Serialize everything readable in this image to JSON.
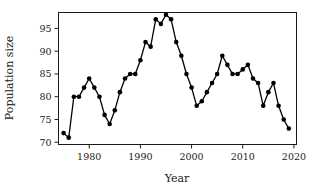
{
  "chart_data": {
    "type": "line",
    "title": "",
    "xlabel": "Year",
    "ylabel": "Population size",
    "xlim": [
      1974,
      2020.5
    ],
    "ylim": [
      69.5,
      98.5
    ],
    "xticks": [
      1980,
      1990,
      2000,
      2010,
      2020
    ],
    "yticks": [
      70,
      75,
      80,
      85,
      90,
      95
    ],
    "grid": false,
    "legend": null,
    "marker": "filled-circle",
    "line_color": "#000000",
    "marker_color": "#000000",
    "x": [
      1975,
      1976,
      1977,
      1978,
      1979,
      1980,
      1981,
      1982,
      1983,
      1984,
      1985,
      1986,
      1987,
      1988,
      1989,
      1990,
      1991,
      1992,
      1993,
      1994,
      1995,
      1996,
      1997,
      1998,
      1999,
      2000,
      2001,
      2002,
      2003,
      2004,
      2005,
      2006,
      2007,
      2008,
      2009,
      2010,
      2011,
      2012,
      2013,
      2014,
      2015,
      2016,
      2017,
      2018,
      2019
    ],
    "values": [
      72,
      71,
      80,
      80,
      82,
      84,
      82,
      80,
      76,
      74,
      77,
      81,
      84,
      85,
      85,
      88,
      92,
      91,
      97,
      96,
      98,
      97,
      92,
      89,
      85,
      82,
      78,
      79,
      81,
      83,
      85,
      89,
      87,
      85,
      85,
      86,
      87,
      84,
      83,
      78,
      81,
      83,
      78,
      75,
      73
    ],
    "series": [
      {
        "name": "Population size",
        "values": [
          72,
          71,
          80,
          80,
          82,
          84,
          82,
          80,
          76,
          74,
          77,
          81,
          84,
          85,
          85,
          88,
          92,
          91,
          97,
          96,
          98,
          97,
          92,
          89,
          85,
          82,
          78,
          79,
          81,
          83,
          85,
          89,
          87,
          85,
          85,
          86,
          87,
          84,
          83,
          78,
          81,
          83,
          78,
          75,
          73
        ]
      }
    ]
  },
  "axes": {
    "x_title": "Year",
    "y_title": "Population size",
    "x_tick_labels": [
      "1980",
      "1990",
      "2000",
      "2010",
      "2020"
    ],
    "y_tick_labels": [
      "70",
      "75",
      "80",
      "85",
      "90",
      "95"
    ]
  }
}
